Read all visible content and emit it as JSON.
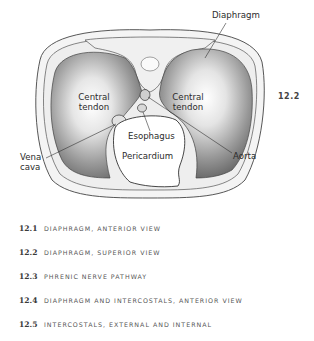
{
  "figure": {
    "number": "12.2",
    "labels": {
      "diaphragm": "Diaphragm",
      "central_tendon_left_1": "Central",
      "central_tendon_left_2": "tendon",
      "central_tendon_right_1": "Central",
      "central_tendon_right_2": "tendon",
      "esophagus": "Esophagus",
      "pericardium": "Pericardium",
      "vena_cava_1": "Vena",
      "vena_cava_2": "cava",
      "aorta": "Aorta"
    }
  },
  "captions": [
    {
      "num": "12.1",
      "text": "DIAPHRAGM, ANTERIOR VIEW"
    },
    {
      "num": "12.2",
      "text": "DIAPHRAGM, SUPERIOR VIEW"
    },
    {
      "num": "12.3",
      "text": "PHRENIC NERVE PATHWAY"
    },
    {
      "num": "12.4",
      "text": "DIAPHRAGM AND INTERCOSTALS, ANTERIOR VIEW"
    },
    {
      "num": "12.5",
      "text": "INTERCOSTALS, EXTERNAL AND INTERNAL"
    }
  ]
}
